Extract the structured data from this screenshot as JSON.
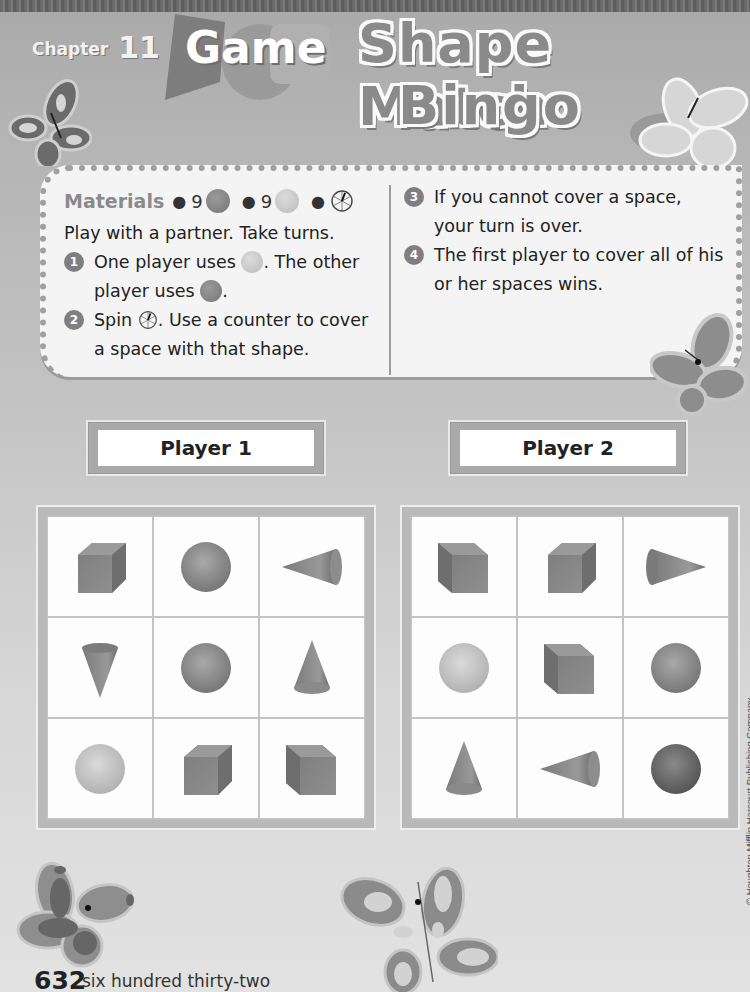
{
  "header": {
    "chapter_label": "Chapter",
    "chapter_number": "11",
    "badge_label": "Game",
    "title_line_1": "Shape Match",
    "title_line_2": "Bingo"
  },
  "instructions": {
    "materials_label": "Materials",
    "materials": [
      {
        "quantity": "9",
        "item": "dark-counter"
      },
      {
        "quantity": "9",
        "item": "light-counter"
      },
      {
        "quantity": "",
        "item": "spinner"
      }
    ],
    "intro": "Play with a partner. Take turns.",
    "steps": [
      {
        "number": "1",
        "text_a": "One player uses",
        "text_b": ". The other player uses",
        "text_c": "."
      },
      {
        "number": "2",
        "text_a": "Spin",
        "text_b": ". Use a counter to cover a space with that shape."
      },
      {
        "number": "3",
        "text": "If you cannot cover a space, your turn is over."
      },
      {
        "number": "4",
        "text": "The first player to cover all of his or her spaces wins."
      }
    ]
  },
  "players": [
    {
      "label": "Player 1",
      "board": [
        [
          "cube",
          "sphere",
          "cone-sideways-left"
        ],
        [
          "cone-inverted",
          "sphere",
          "cone-upright"
        ],
        [
          "sphere-light",
          "cube",
          "cube-back"
        ]
      ]
    },
    {
      "label": "Player 2",
      "board": [
        [
          "cube-back",
          "cube",
          "cone-sideways-right"
        ],
        [
          "sphere-light",
          "cube-back",
          "sphere"
        ],
        [
          "cone-upright",
          "cone-sideways-left",
          "sphere-dark"
        ]
      ]
    }
  ],
  "footer": {
    "page_number": "632",
    "page_words": "six hundred thirty-two",
    "copyright": "© Houghton Mifflin Harcourt Publishing Company"
  },
  "colors": {
    "background": "#c2c2c2",
    "card": "#f4f4f4",
    "title_fill": "#8a8a8a",
    "shape_dark": "#6f6f6f",
    "shape_mid": "#8c8c8c",
    "shape_light": "#c9c9c9"
  }
}
